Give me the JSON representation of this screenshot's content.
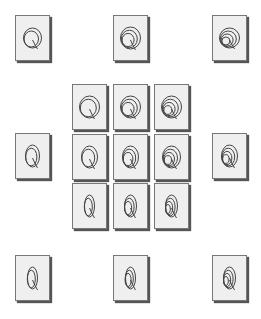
{
  "diagram": {
    "title": "",
    "colors": {
      "card_fill": "#efefef",
      "card_border": "#777777",
      "shadow": "#555555",
      "stroke": "#444444"
    },
    "cards": [
      {
        "id": "top-left",
        "x": 15,
        "y": 15,
        "loops": 2,
        "rx": 9,
        "ry": 10,
        "tilt": 0
      },
      {
        "id": "top-center",
        "x": 113,
        "y": 15,
        "loops": 3,
        "rx": 10,
        "ry": 11,
        "tilt": 0
      },
      {
        "id": "top-right",
        "x": 212,
        "y": 15,
        "loops": 4,
        "rx": 10,
        "ry": 10,
        "tilt": 0
      },
      {
        "id": "grid-r1-c1",
        "x": 72,
        "y": 84,
        "loops": 2,
        "rx": 10,
        "ry": 11,
        "tilt": 0
      },
      {
        "id": "grid-r1-c2",
        "x": 113,
        "y": 84,
        "loops": 3,
        "rx": 10,
        "ry": 11,
        "tilt": 0
      },
      {
        "id": "grid-r1-c3",
        "x": 154,
        "y": 84,
        "loops": 4,
        "rx": 10,
        "ry": 11,
        "tilt": 0
      },
      {
        "id": "middle-left",
        "x": 15,
        "y": 133,
        "loops": 2,
        "rx": 7,
        "ry": 11,
        "tilt": 0
      },
      {
        "id": "grid-r2-c1",
        "x": 72,
        "y": 134,
        "loops": 2,
        "rx": 8,
        "ry": 11,
        "tilt": 0
      },
      {
        "id": "grid-r2-c2",
        "x": 113,
        "y": 134,
        "loops": 3,
        "rx": 8,
        "ry": 11,
        "tilt": 0
      },
      {
        "id": "grid-r2-c3",
        "x": 154,
        "y": 134,
        "loops": 4,
        "rx": 9,
        "ry": 11,
        "tilt": 0
      },
      {
        "id": "middle-right",
        "x": 212,
        "y": 133,
        "loops": 4,
        "rx": 8,
        "ry": 11,
        "tilt": 0
      },
      {
        "id": "grid-r3-c1",
        "x": 72,
        "y": 183,
        "loops": 2,
        "rx": 5,
        "ry": 11,
        "tilt": 0
      },
      {
        "id": "grid-r3-c2",
        "x": 113,
        "y": 183,
        "loops": 3,
        "rx": 6,
        "ry": 11,
        "tilt": 0
      },
      {
        "id": "grid-r3-c3",
        "x": 154,
        "y": 183,
        "loops": 4,
        "rx": 6,
        "ry": 11,
        "tilt": 0
      },
      {
        "id": "bottom-left",
        "x": 15,
        "y": 255,
        "loops": 2,
        "rx": 5,
        "ry": 11,
        "tilt": 0
      },
      {
        "id": "bottom-center",
        "x": 113,
        "y": 255,
        "loops": 3,
        "rx": 5,
        "ry": 11,
        "tilt": 0
      },
      {
        "id": "bottom-right",
        "x": 212,
        "y": 255,
        "loops": 4,
        "rx": 6,
        "ry": 11,
        "tilt": 0
      }
    ]
  }
}
